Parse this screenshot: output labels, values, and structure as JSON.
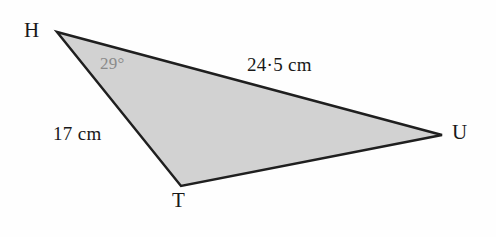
{
  "figure": {
    "type": "triangle-diagram",
    "background_color": "#fefefe",
    "fill_color": "#d2d2d2",
    "stroke_color": "#1f1f1f",
    "stroke_width": 2.5,
    "angle_text_color": "#8a8a8a",
    "label_text_color": "#191919",
    "vertices": {
      "H": {
        "label": "H",
        "x": 57,
        "y": 32
      },
      "T": {
        "label": "T",
        "x": 181,
        "y": 186
      },
      "U": {
        "label": "U",
        "x": 442,
        "y": 135
      }
    },
    "sides": {
      "HU": {
        "label": "24·5 cm",
        "from": "H",
        "to": "U"
      },
      "HT": {
        "label": "17 cm",
        "from": "H",
        "to": "T"
      },
      "TU": {
        "label": "",
        "from": "T",
        "to": "U"
      }
    },
    "angles": {
      "H": {
        "label": "29°",
        "at": "H"
      }
    },
    "polygon_points": "57,32 442,135 181,186"
  }
}
